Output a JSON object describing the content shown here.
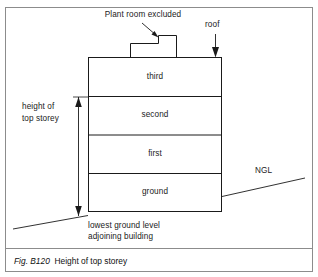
{
  "figure": {
    "caption_number": "Fig. B120",
    "caption_title": "Height of top storey"
  },
  "annotations": {
    "plant_room": "Plant room excluded",
    "roof": "roof",
    "ngl": "NGL",
    "height_dimension_line1": "height of",
    "height_dimension_line2": "top storey",
    "ground_note_line1": "lowest ground level",
    "ground_note_line2": "adjoining building"
  },
  "building": {
    "storeys": [
      {
        "label": "third"
      },
      {
        "label": "second"
      },
      {
        "label": "first"
      },
      {
        "label": "ground"
      }
    ]
  },
  "colors": {
    "line": "#1a1a1a",
    "frame": "#8c8c8c",
    "text": "#1a1a1a",
    "background": "#ffffff"
  }
}
